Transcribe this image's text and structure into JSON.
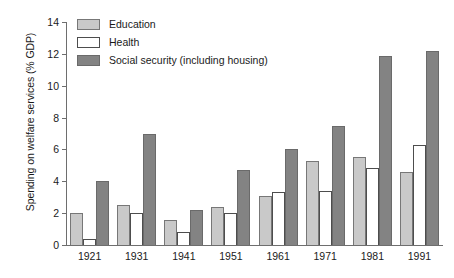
{
  "chart_data": {
    "type": "bar",
    "title": "",
    "subtitle": "",
    "xlabel": "",
    "ylabel": "Spending on welfare services (% GDP)",
    "categories": [
      "1921",
      "1931",
      "1941",
      "1951",
      "1961",
      "1971",
      "1981",
      "1991"
    ],
    "series": [
      {
        "name": "Education",
        "color": "#c9c9c9",
        "values": [
          2.0,
          2.5,
          1.6,
          2.4,
          3.1,
          5.3,
          5.55,
          4.6
        ]
      },
      {
        "name": "Health",
        "color": "#ffffff",
        "values": [
          0.4,
          2.0,
          0.8,
          2.0,
          3.35,
          3.4,
          4.85,
          6.3
        ]
      },
      {
        "name": "Social security (including housing)",
        "color": "#838383",
        "values": [
          4.0,
          7.0,
          2.2,
          4.7,
          6.0,
          7.5,
          11.85,
          12.2
        ]
      }
    ],
    "ylim": [
      0,
      14
    ],
    "yticks": [
      0,
      2,
      4,
      6,
      8,
      10,
      12,
      14
    ],
    "ytick_labels": [
      "0",
      "2",
      "4",
      "6",
      "8",
      "10",
      "12",
      "14"
    ],
    "grid": false,
    "legend_position": "top-left",
    "legend_entries": [
      "Education",
      "Health",
      "Social security (including housing)"
    ]
  }
}
